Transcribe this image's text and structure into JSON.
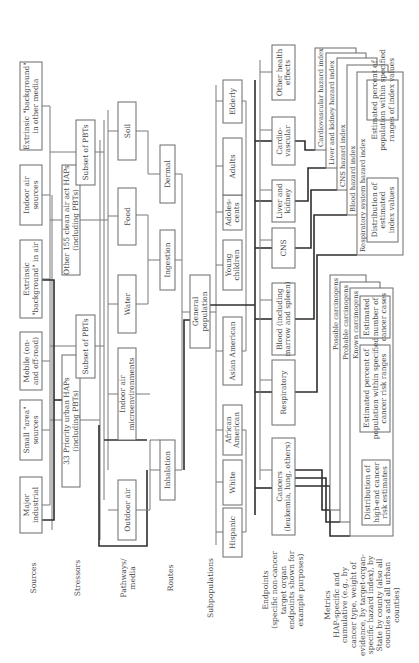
{
  "diagram": {
    "orientation": "rotated -90deg (landscape diagram shown sideways)",
    "row_labels": {
      "sources": "Sources",
      "stressors": "Stressors",
      "pathways": [
        "Pathways/",
        "media"
      ],
      "routes": "Routes",
      "subpopulations": "Subpopulations",
      "endpoints": [
        "Endpoints",
        "(specific non-cancer",
        "target organ",
        "endpoints shown for",
        "example purposes)"
      ],
      "metrics": [
        "Metrics",
        "HAP-specific and",
        "cumulative (e.g., by",
        "cancer type, weight of",
        "evidence, by target-organ-",
        "specific hazard index), by",
        "State by county (also all",
        "counties and all urban",
        "counties)"
      ]
    },
    "sources": [
      {
        "id": "major-industrial",
        "lines": [
          "Major",
          "industrial"
        ]
      },
      {
        "id": "small-area",
        "lines": [
          "Small \"area\"",
          "sources"
        ]
      },
      {
        "id": "mobile",
        "lines": [
          "Mobile (on-",
          "and off-road)"
        ]
      },
      {
        "id": "extrinsic-air",
        "lines": [
          "Extrinsic",
          "\"background\" in air"
        ]
      },
      {
        "id": "indoor-air-sources",
        "lines": [
          "Indoor air",
          "sources"
        ]
      },
      {
        "id": "extrinsic-other",
        "lines": [
          "Extrinsic \"background\"",
          "in other media"
        ]
      }
    ],
    "stressors": [
      {
        "id": "priority-33",
        "lines": [
          "33 Priority urban HAPs",
          "(including PBTs)"
        ]
      },
      {
        "id": "subset-pbts-1",
        "lines": [
          "Subset of PBTs"
        ]
      },
      {
        "id": "other-155",
        "lines": [
          "Other 155 clean air act HAPs",
          "(including PBTs)"
        ]
      },
      {
        "id": "subset-pbts-2",
        "lines": [
          "Subset of PBTs"
        ]
      }
    ],
    "pathways": [
      {
        "id": "outdoor-air",
        "lines": [
          "Outdoor air"
        ]
      },
      {
        "id": "indoor-micro",
        "lines": [
          "Indoor air",
          "microenvironments"
        ]
      },
      {
        "id": "water",
        "lines": [
          "Water"
        ]
      },
      {
        "id": "food",
        "lines": [
          "Food"
        ]
      },
      {
        "id": "soil",
        "lines": [
          "Soil"
        ]
      }
    ],
    "routes": [
      {
        "id": "inhalation",
        "lines": [
          "Inhalation"
        ]
      },
      {
        "id": "ingestion",
        "lines": [
          "Ingestion"
        ]
      },
      {
        "id": "dermal",
        "lines": [
          "Dermal"
        ]
      }
    ],
    "population": {
      "id": "general-population",
      "lines": [
        "General",
        "population"
      ]
    },
    "subpopulations": [
      {
        "id": "hispanic",
        "lines": [
          "Hispanic"
        ]
      },
      {
        "id": "white",
        "lines": [
          "White"
        ]
      },
      {
        "id": "african-american",
        "lines": [
          "African",
          "American"
        ]
      },
      {
        "id": "asian-american",
        "lines": [
          "Asian American"
        ]
      },
      {
        "id": "young-children",
        "lines": [
          "Young",
          "children"
        ]
      },
      {
        "id": "adolescents",
        "lines": [
          "Adoles-",
          "cents"
        ]
      },
      {
        "id": "adults",
        "lines": [
          "Adults"
        ]
      },
      {
        "id": "elderly",
        "lines": [
          "Elderly"
        ]
      }
    ],
    "endpoints": [
      {
        "id": "cancers",
        "lines": [
          "Cancers",
          "(leukemia, lung, others)"
        ]
      },
      {
        "id": "respiratory",
        "lines": [
          "Respiratory"
        ]
      },
      {
        "id": "blood",
        "lines": [
          "Blood (including",
          "marrow and spleen)"
        ]
      },
      {
        "id": "cns",
        "lines": [
          "CNS"
        ]
      },
      {
        "id": "liver-kidney",
        "lines": [
          "Liver and",
          "kidney"
        ]
      },
      {
        "id": "cardiovascular",
        "lines": [
          "Cardio-",
          "vascular"
        ]
      },
      {
        "id": "other-health",
        "lines": [
          "Other health",
          "effects"
        ]
      }
    ],
    "cancer_metrics": {
      "stack_titles": [
        "Possible carcinogens",
        "Probable carcinogens",
        "Known carcinogens"
      ],
      "boxes": [
        {
          "id": "distribution-cancer",
          "lines": [
            "Distribution of",
            "high-end cancer",
            "risk estimates"
          ]
        },
        {
          "id": "percent-cancer",
          "lines": [
            "Estimated percent of",
            "population within specified",
            "cancer risk ranges"
          ]
        },
        {
          "id": "number-cancer",
          "lines": [
            "Estimated",
            "number of",
            "cancer cases"
          ]
        }
      ]
    },
    "hazard_metrics": {
      "stack_titles": [
        "Cardiovascular hazard index",
        "Liver and kidney hazard index",
        "CNS hazard index",
        "Blood hazard index",
        "Respiratory system hazard index"
      ],
      "boxes": [
        {
          "id": "distribution-index",
          "lines": [
            "Distribution of",
            "estimated",
            "index values"
          ]
        },
        {
          "id": "percent-index",
          "lines": [
            "Estimated percent of",
            "population within specified",
            "ranges of index values"
          ]
        }
      ]
    }
  }
}
